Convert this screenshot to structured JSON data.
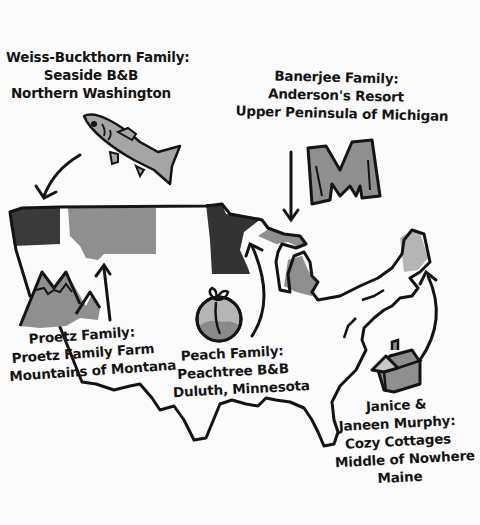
{
  "colors": {
    "background": "#fbfbfb",
    "ink": "#141414",
    "dark_fill": "#3a3a3a",
    "mid_fill": "#8c8c8c",
    "light_fill": "#b8b8b8"
  },
  "callouts": [
    {
      "id": "washington",
      "family": "Weiss-Buckthorn Family:",
      "resort": "Seaside B&B",
      "location": "Northern Washington",
      "icon": "fish-icon"
    },
    {
      "id": "michigan",
      "family": "Banerjee Family:",
      "resort": "Anderson's Resort",
      "location": "Upper Peninsula of Michigan",
      "icon": "letter-m-icon"
    },
    {
      "id": "montana",
      "family": "Proetz Family:",
      "resort": "Proetz Family Farm",
      "location": "Mountains of Montana",
      "icon": "mountains-icon"
    },
    {
      "id": "minnesota",
      "family": "Peach Family:",
      "resort": "Peachtree B&B",
      "location": "Duluth, Minnesota",
      "icon": "peach-icon"
    },
    {
      "id": "maine",
      "family_line1": "Janice &",
      "family_line2": "Janeen Murphy:",
      "resort": "Cozy Cottages",
      "location_line1": "Middle of Nowhere",
      "location_line2": "Maine",
      "icon": "cottage-icon"
    }
  ],
  "highlighted_states": [
    {
      "name": "Washington",
      "shade": "dark"
    },
    {
      "name": "Montana",
      "shade": "mid"
    },
    {
      "name": "Minnesota",
      "shade": "dark"
    },
    {
      "name": "Michigan",
      "shade": "mid"
    },
    {
      "name": "Maine",
      "shade": "light"
    }
  ]
}
